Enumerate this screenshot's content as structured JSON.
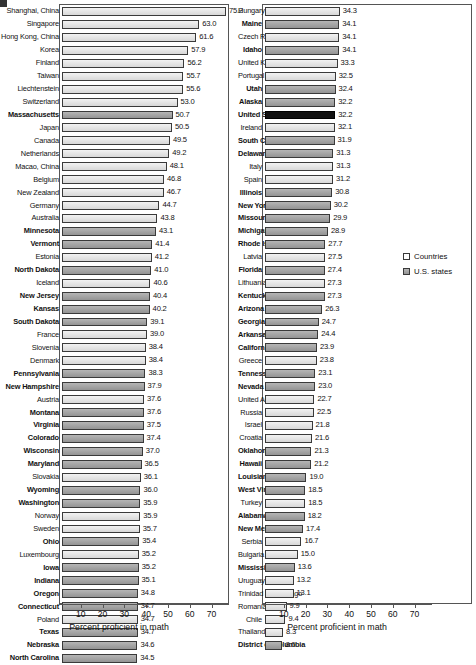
{
  "chart_data": {
    "type": "bar",
    "orientation": "horizontal",
    "title": "",
    "xlabel": "Percent proficient in math",
    "ylabel": "",
    "xlim": [
      0,
      78
    ],
    "xticks": [
      10,
      20,
      30,
      40,
      50,
      60,
      70
    ],
    "grid": false,
    "legend_position": "right-panel-middle",
    "legend": [
      {
        "label": "Countries",
        "key": "country"
      },
      {
        "label": "U.S. states",
        "key": "state"
      }
    ],
    "series": [
      {
        "name": "Percent proficient in math",
        "values_by_category": true
      }
    ],
    "panels": [
      {
        "name": "left-panel",
        "categories": [
          "Shanghai, China",
          "Singapore",
          "Hong Kong, China",
          "Korea",
          "Finland",
          "Taiwan",
          "Liechtenstein",
          "Switzerland",
          "Massachusetts",
          "Japan",
          "Canada",
          "Netherlands",
          "Macao, China",
          "Belgium",
          "New Zealand",
          "Germany",
          "Australia",
          "Minnesota",
          "Vermont",
          "Estonia",
          "North Dakota",
          "Iceland",
          "New Jersey",
          "Kansas",
          "South Dakota",
          "France",
          "Slovenia",
          "Denmark",
          "Pennsylvania",
          "New Hampshire",
          "Austria",
          "Montana",
          "Virginia",
          "Colorado",
          "Wisconsin",
          "Maryland",
          "Slovakia",
          "Wyoming",
          "Washington",
          "Norway",
          "Sweden",
          "Ohio",
          "Luxembourg",
          "Iowa",
          "Indiana",
          "Oregon",
          "Connecticut",
          "Poland",
          "Texas",
          "Nebraska",
          "North Carolina"
        ],
        "values": [
          75.2,
          63.0,
          61.6,
          57.9,
          56.2,
          55.7,
          55.6,
          53.0,
          50.7,
          50.5,
          49.5,
          49.2,
          48.1,
          46.8,
          46.7,
          44.7,
          43.8,
          43.1,
          41.4,
          41.2,
          41.0,
          40.6,
          40.4,
          40.2,
          39.1,
          39.0,
          38.4,
          38.4,
          38.3,
          37.9,
          37.6,
          37.6,
          37.5,
          37.4,
          37.0,
          36.5,
          36.1,
          36.0,
          35.9,
          35.9,
          35.7,
          35.4,
          35.2,
          35.2,
          35.1,
          34.8,
          34.7,
          34.7,
          34.7,
          34.6,
          34.5
        ],
        "kinds": [
          "country",
          "country",
          "country",
          "country",
          "country",
          "country",
          "country",
          "country",
          "state",
          "country",
          "country",
          "country",
          "country",
          "country",
          "country",
          "country",
          "country",
          "state",
          "state",
          "country",
          "state",
          "country",
          "state",
          "state",
          "state",
          "country",
          "country",
          "country",
          "state",
          "state",
          "country",
          "state",
          "state",
          "state",
          "state",
          "state",
          "country",
          "state",
          "state",
          "country",
          "country",
          "state",
          "country",
          "state",
          "state",
          "state",
          "state",
          "country",
          "state",
          "state",
          "state"
        ]
      },
      {
        "name": "right-panel",
        "categories": [
          "Hungary",
          "Maine",
          "Czech Republic",
          "Idaho",
          "United Kingdom",
          "Portugal",
          "Utah",
          "Alaska",
          "United States",
          "Ireland",
          "South Carolina",
          "Delaware",
          "Italy",
          "Spain",
          "Illinois",
          "New York",
          "Missouri",
          "Michigan",
          "Rhode Island",
          "Latvia",
          "Florida",
          "Lithuania",
          "Kentucky",
          "Arizona",
          "Georgia",
          "Arkansas",
          "California",
          "Greece",
          "Tennessee",
          "Nevada",
          "United Arab Emirates",
          "Russia",
          "Israel",
          "Croatia",
          "Oklahoma",
          "Hawaii",
          "Louisiana",
          "West Virginia",
          "Turkey",
          "Alabama",
          "New Mexico",
          "Serbia",
          "Bulgaria",
          "Mississippi",
          "Uruguay",
          "Trinidad and Tobago",
          "Romania",
          "Chile",
          "Thailand",
          "District of Columbia"
        ],
        "values": [
          34.3,
          34.1,
          34.1,
          34.1,
          33.3,
          32.5,
          32.4,
          32.2,
          32.2,
          32.1,
          31.9,
          31.3,
          31.3,
          31.2,
          30.8,
          30.2,
          29.9,
          28.9,
          27.7,
          27.5,
          27.4,
          27.3,
          27.3,
          26.3,
          24.7,
          24.4,
          23.9,
          23.8,
          23.1,
          23.0,
          22.7,
          22.5,
          21.8,
          21.6,
          21.3,
          21.2,
          19.0,
          18.5,
          18.5,
          18.2,
          17.4,
          16.7,
          15.0,
          13.6,
          13.2,
          13.1,
          9.9,
          9.4,
          8.3,
          8.0
        ],
        "kinds": [
          "country",
          "state",
          "country",
          "state",
          "country",
          "country",
          "state",
          "state",
          "highlight",
          "country",
          "state",
          "state",
          "country",
          "country",
          "state",
          "state",
          "state",
          "state",
          "state",
          "country",
          "state",
          "country",
          "state",
          "state",
          "state",
          "state",
          "state",
          "country",
          "state",
          "state",
          "country",
          "country",
          "country",
          "country",
          "state",
          "state",
          "state",
          "state",
          "country",
          "state",
          "state",
          "country",
          "country",
          "state",
          "country",
          "country",
          "country",
          "country",
          "country",
          "state"
        ]
      }
    ]
  },
  "colors": {
    "country_bar": "#e8e8e8",
    "state_bar": "#a0a0a0",
    "highlight_bar": "#111111",
    "frame": "#555555"
  }
}
